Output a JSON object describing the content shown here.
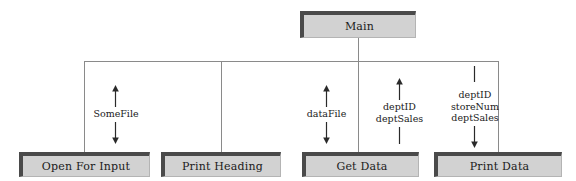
{
  "diagram": {
    "title": "Main",
    "type": "structure-chart"
  },
  "modules": [
    {
      "id": "main",
      "label": "Main",
      "level": "top"
    },
    {
      "id": "open-for-input",
      "label": "Open For Input",
      "level": "sub"
    },
    {
      "id": "print-heading",
      "label": "Print Heading",
      "level": "sub"
    },
    {
      "id": "get-data",
      "label": "Get Data",
      "level": "sub"
    },
    {
      "id": "print-data",
      "label": "Print Data",
      "level": "sub"
    }
  ],
  "couples": [
    {
      "id": "couple-somefile",
      "target": "open-for-input",
      "lines": [
        "SomeFile"
      ],
      "top_marker": "arrow-up",
      "bottom_marker": "arrow-down"
    },
    {
      "id": "couple-datafile",
      "target": "get-data",
      "lines": [
        "dataFile"
      ],
      "top_marker": "arrow-up",
      "bottom_marker": "arrow-down"
    },
    {
      "id": "couple-deptid-deptsales",
      "target": "get-data",
      "lines": [
        "deptID",
        "deptSales"
      ],
      "top_marker": "arrow-up",
      "bottom_marker": "plain-line"
    },
    {
      "id": "couple-deptid-storenum-deptsales",
      "target": "print-data",
      "lines": [
        "deptID",
        "storeNum",
        "deptSales"
      ],
      "top_marker": "plain-line",
      "bottom_marker": "arrow-down"
    }
  ],
  "colors": {
    "box_fill": "#d2d2d2",
    "box_shadow_border": "#4a4a4a",
    "connector_line": "#8a8a8a",
    "text": "#1a1a1a",
    "background": "#ffffff"
  }
}
